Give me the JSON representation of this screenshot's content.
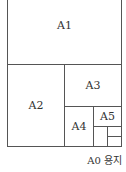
{
  "diagram": {
    "sheets": [
      {
        "id": "A1",
        "label": "A1"
      },
      {
        "id": "A2",
        "label": "A2"
      },
      {
        "id": "A3",
        "label": "A3"
      },
      {
        "id": "A4",
        "label": "A4"
      },
      {
        "id": "A5",
        "label": "A5"
      }
    ],
    "caption": "A0 용지",
    "line_color": "#555555"
  }
}
